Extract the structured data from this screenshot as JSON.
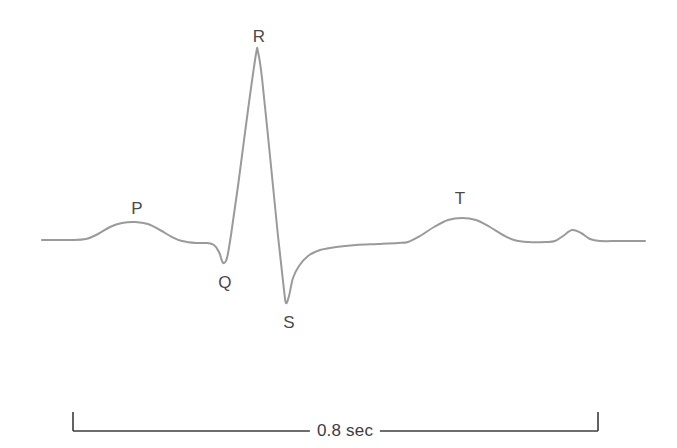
{
  "figure": {
    "kind": "ecg-waveform-diagram",
    "background_color": "#ffffff",
    "width": 677,
    "height": 448
  },
  "chart_data": {
    "type": "line",
    "title": "",
    "subtitle": "",
    "xlabel": "",
    "ylabel": "",
    "grid": false,
    "legend": false,
    "axis_visible": false,
    "series": [
      {
        "name": "ECG trace",
        "color": "#9a9a9a",
        "line_width": 2,
        "baseline_y": 240,
        "points": [
          [
            42,
            240
          ],
          [
            70,
            240
          ],
          [
            86,
            239
          ],
          [
            98,
            234
          ],
          [
            110,
            227
          ],
          [
            122,
            223
          ],
          [
            135,
            222
          ],
          [
            148,
            224
          ],
          [
            160,
            230
          ],
          [
            172,
            237
          ],
          [
            182,
            241
          ],
          [
            196,
            243
          ],
          [
            207,
            243
          ],
          [
            214,
            245
          ],
          [
            219,
            252
          ],
          [
            222,
            261
          ],
          [
            224,
            263
          ],
          [
            227,
            258
          ],
          [
            231,
            235
          ],
          [
            238,
            186
          ],
          [
            248,
            110
          ],
          [
            256,
            54
          ],
          [
            258,
            52
          ],
          [
            262,
            78
          ],
          [
            270,
            156
          ],
          [
            278,
            236
          ],
          [
            284,
            290
          ],
          [
            286,
            303
          ],
          [
            289,
            296
          ],
          [
            293,
            278
          ],
          [
            299,
            266
          ],
          [
            308,
            256
          ],
          [
            320,
            250
          ],
          [
            336,
            247
          ],
          [
            356,
            245
          ],
          [
            378,
            244
          ],
          [
            398,
            243
          ],
          [
            408,
            242
          ],
          [
            420,
            236
          ],
          [
            434,
            227
          ],
          [
            448,
            220
          ],
          [
            462,
            218
          ],
          [
            476,
            220
          ],
          [
            490,
            227
          ],
          [
            503,
            235
          ],
          [
            514,
            240
          ],
          [
            528,
            242
          ],
          [
            546,
            242
          ],
          [
            555,
            241
          ],
          [
            563,
            236
          ],
          [
            572,
            230
          ],
          [
            581,
            233
          ],
          [
            590,
            239
          ],
          [
            600,
            241
          ],
          [
            620,
            241
          ],
          [
            645,
            241
          ]
        ]
      }
    ],
    "annotations": [
      {
        "id": "p-wave",
        "label": "P",
        "label_x": 137,
        "label_y": 208,
        "peak_x": 135,
        "peak_y": 222
      },
      {
        "id": "q-wave",
        "label": "Q",
        "label_x": 225,
        "label_y": 282,
        "peak_x": 222,
        "peak_y": 262
      },
      {
        "id": "r-wave",
        "label": "R",
        "label_x": 259,
        "label_y": 36,
        "peak_x": 257,
        "peak_y": 52
      },
      {
        "id": "s-wave",
        "label": "S",
        "label_x": 289,
        "label_y": 322,
        "peak_x": 286,
        "peak_y": 303
      },
      {
        "id": "t-wave",
        "label": "T",
        "label_x": 460,
        "label_y": 198,
        "peak_x": 462,
        "peak_y": 218
      }
    ],
    "scale_bar": {
      "label": "0.8 sec",
      "label_x": 345,
      "label_y": 430,
      "x_start": 73,
      "x_end": 598,
      "rule_y": 431,
      "tick_top_y": 412,
      "color": "#3c3c3c",
      "value": 0.8,
      "unit": "sec"
    },
    "colors": {
      "trace": "#9a9a9a",
      "label_text": "#4a4a4a",
      "scale_text": "#3c3c3c",
      "scale_rule": "#3c3c3c",
      "background": "#ffffff"
    }
  }
}
